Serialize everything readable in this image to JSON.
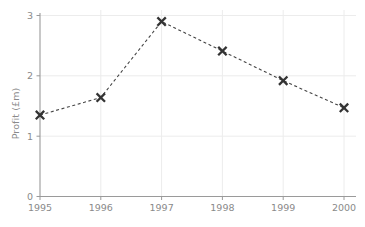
{
  "chart_data": {
    "type": "line",
    "title": "",
    "subtitle": "",
    "xlabel": "",
    "ylabel": "Profit (£m)",
    "categories": [
      "1995",
      "1996",
      "1997",
      "1998",
      "1999",
      "2000"
    ],
    "x": [
      1995,
      1996,
      1997,
      1998,
      1999,
      2000
    ],
    "values": [
      1.35,
      1.64,
      2.9,
      2.41,
      1.92,
      1.47
    ],
    "series": [
      {
        "name": "Profit",
        "values": [
          1.35,
          1.64,
          2.9,
          2.41,
          1.92,
          1.47
        ]
      }
    ],
    "xlim": [
      1995,
      2000
    ],
    "ylim": [
      0,
      3
    ],
    "yticks": [
      "0",
      "1",
      "2",
      "3"
    ],
    "ytick_values": [
      0,
      1,
      2,
      3
    ],
    "xticks": [
      "1995",
      "1996",
      "1997",
      "1998",
      "1999",
      "2000"
    ],
    "grid": true,
    "legend": false,
    "legend_position": "none",
    "marker": "x",
    "linestyle": "dashed",
    "annotations": []
  },
  "style": {
    "line_color": "#444444",
    "marker_color": "#333333",
    "grid_color": "#ececec",
    "axis_color": "#9a9a9a",
    "tick_label_color": "#8a8a8a",
    "axis_label_color": "#8a8a8a",
    "background": "#ffffff"
  },
  "axis": {
    "y_label_text": "Profit (£m)"
  }
}
